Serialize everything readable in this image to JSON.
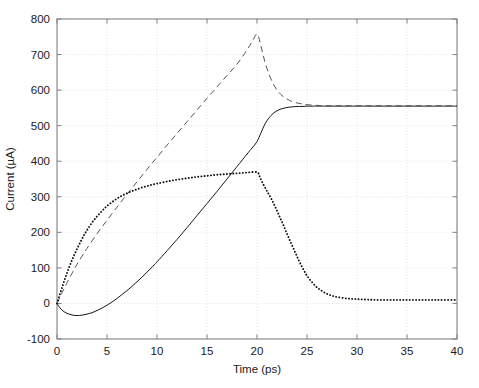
{
  "chart_data": {
    "type": "line",
    "title": "",
    "xlabel": "Time (ps)",
    "ylabel": "Current (µA)",
    "xlim": [
      0,
      40
    ],
    "ylim": [
      -100,
      800
    ],
    "xticks": [
      0,
      5,
      10,
      15,
      20,
      25,
      30,
      35,
      40
    ],
    "xticklabels": [
      "0",
      "5",
      "10",
      "15",
      "20",
      "25",
      "30",
      "35",
      "40"
    ],
    "yticks": [
      -100,
      0,
      100,
      200,
      300,
      400,
      500,
      600,
      700,
      800
    ],
    "yticklabels": [
      "-100",
      "0",
      "100",
      "200",
      "300",
      "400",
      "500",
      "600",
      "700",
      "800"
    ],
    "grid": true,
    "grid_style": "dotted",
    "legend": null,
    "axis_color": "#808080",
    "series": [
      {
        "name": "solid-curve",
        "style": "solid",
        "color": "#1a1a1a",
        "x": [
          0,
          0.4,
          0.8,
          1.2,
          1.6,
          2.0,
          2.5,
          3.0,
          3.5,
          4.0,
          4.5,
          5.0,
          5.5,
          6.0,
          6.5,
          7.0,
          7.5,
          8.0,
          8.5,
          9.0,
          9.5,
          10.0,
          11.0,
          12.0,
          13.0,
          14.0,
          15.0,
          16.0,
          17.0,
          18.0,
          19.0,
          19.5,
          20.0,
          20.4,
          20.8,
          21.2,
          21.6,
          22.0,
          22.4,
          22.8,
          23.2,
          23.6,
          24.0,
          24.5,
          25.0,
          25.5,
          26.0,
          27.0,
          28.0,
          29.0,
          30.0,
          32.0,
          34.0,
          36.0,
          38.0,
          40.0
        ],
        "y": [
          0,
          -16,
          -25,
          -30,
          -33,
          -34,
          -33,
          -30,
          -26,
          -20,
          -13,
          -5,
          4,
          14,
          25,
          36,
          48,
          61,
          74,
          88,
          102,
          117,
          148,
          180,
          213,
          247,
          281,
          315,
          350,
          385,
          420,
          437,
          455,
          480,
          505,
          522,
          534,
          542,
          547,
          550,
          552,
          553,
          554,
          554,
          555,
          555,
          555,
          555,
          555,
          555,
          555,
          555,
          555,
          555,
          555,
          555
        ]
      },
      {
        "name": "dashed-curve",
        "style": "dashed",
        "color": "#555555",
        "x": [
          0,
          0.5,
          1.0,
          1.5,
          2.0,
          2.5,
          3.0,
          4.0,
          5.0,
          6.0,
          7.0,
          8.0,
          9.0,
          10.0,
          11.0,
          12.0,
          13.0,
          14.0,
          15.0,
          16.0,
          17.0,
          18.0,
          19.0,
          19.5,
          20.0,
          20.3,
          20.6,
          21.0,
          21.5,
          22.0,
          22.5,
          23.0,
          23.5,
          24.0,
          24.5,
          25.0,
          26.0,
          27.0,
          28.0,
          29.0,
          30.0,
          32.0,
          34.0,
          36.0,
          38.0,
          40.0
        ],
        "y": [
          0,
          30,
          58,
          85,
          110,
          133,
          155,
          196,
          234,
          271,
          307,
          342,
          377,
          411,
          445,
          478,
          511,
          544,
          577,
          609,
          641,
          673,
          713,
          736,
          758,
          735,
          700,
          660,
          625,
          600,
          585,
          575,
          568,
          564,
          561,
          559,
          557,
          556,
          556,
          556,
          556,
          556,
          556,
          556,
          556,
          556
        ]
      },
      {
        "name": "dotted-curve",
        "style": "dotted",
        "color": "#111111",
        "x": [
          0,
          0.3,
          0.6,
          0.9,
          1.2,
          1.5,
          1.8,
          2.1,
          2.4,
          2.7,
          3.0,
          3.4,
          3.8,
          4.2,
          4.6,
          5.0,
          5.5,
          6.0,
          6.5,
          7.0,
          7.5,
          8.0,
          8.5,
          9.0,
          9.5,
          10.0,
          11.0,
          12.0,
          13.0,
          14.0,
          15.0,
          16.0,
          17.0,
          18.0,
          19.0,
          20.0,
          20.3,
          20.6,
          21.0,
          21.4,
          21.8,
          22.2,
          22.6,
          23.0,
          23.4,
          23.8,
          24.2,
          24.6,
          25.0,
          25.5,
          26.0,
          26.5,
          27.0,
          27.5,
          28.0,
          29.0,
          30.0,
          31.0,
          32.0,
          34.0,
          36.0,
          38.0,
          40.0
        ],
        "y": [
          0,
          27,
          53,
          78,
          101,
          122,
          141,
          159,
          176,
          192,
          206,
          223,
          238,
          251,
          263,
          274,
          285,
          295,
          303,
          310,
          316,
          321,
          326,
          330,
          334,
          337,
          343,
          348,
          352,
          356,
          359,
          362,
          364,
          366,
          368,
          369,
          355,
          337,
          316,
          296,
          273,
          248,
          223,
          196,
          170,
          145,
          120,
          98,
          78,
          60,
          45,
          35,
          27,
          22,
          18,
          14,
          12,
          11,
          10,
          10,
          10,
          10,
          10
        ]
      }
    ]
  },
  "figure": {
    "background": "#ffffff",
    "plot_left": 57,
    "plot_right": 457,
    "plot_top": 19,
    "plot_bottom": 339
  }
}
